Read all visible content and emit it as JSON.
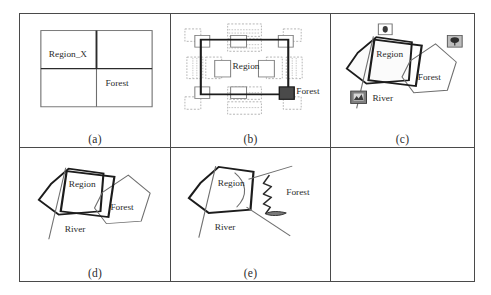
{
  "figure": {
    "panels": [
      {
        "id": "a",
        "label": "(a)",
        "caption_labels": [
          "Region_X",
          "Forest"
        ],
        "annotations": [
          {
            "name": "region-x-label",
            "text": "Region_X",
            "x": 18,
            "y": 48
          },
          {
            "name": "forest-label",
            "text": "Forest",
            "x": 79,
            "y": 80
          }
        ],
        "grid_box": {
          "x": 14,
          "y": 18,
          "w": 118,
          "h": 94,
          "split_x": 0.5,
          "split_y": 0.5
        }
      },
      {
        "id": "b",
        "label": "(b)",
        "annotations": [
          {
            "name": "region-label",
            "text": "Region",
            "x": 60,
            "y": 58
          },
          {
            "name": "forest-label",
            "text": "Forest",
            "x": 104,
            "y": 93
          }
        ],
        "selection_box": {
          "x": 28,
          "y": 25,
          "w": 88,
          "h": 70
        },
        "handle_count": 8,
        "active_handle": "bottom-right"
      },
      {
        "id": "c",
        "label": "(c)",
        "annotations": [
          {
            "name": "region-label",
            "text": "Region",
            "x": 38,
            "y": 48
          },
          {
            "name": "forest-label",
            "text": "Forest",
            "x": 84,
            "y": 80
          },
          {
            "name": "river-label",
            "text": "River",
            "x": 42,
            "y": 105
          }
        ],
        "palette_icons": [
          {
            "name": "stamp-icon",
            "x": 41,
            "y": 14
          },
          {
            "name": "tree-icon",
            "x": 108,
            "y": 27
          },
          {
            "name": "river-icon",
            "x": 18,
            "y": 94
          }
        ]
      },
      {
        "id": "d",
        "label": "(d)",
        "annotations": [
          {
            "name": "region-label",
            "text": "Region",
            "x": 42,
            "y": 36
          },
          {
            "name": "forest-label",
            "text": "Forest",
            "x": 83,
            "y": 65
          },
          {
            "name": "river-label",
            "text": "River",
            "x": 46,
            "y": 92
          }
        ]
      },
      {
        "id": "e",
        "label": "(e)",
        "annotations": [
          {
            "name": "region-label",
            "text": "Region",
            "x": 42,
            "y": 34
          },
          {
            "name": "forest-label",
            "text": "Forest",
            "x": 114,
            "y": 58
          },
          {
            "name": "river-label",
            "text": "River",
            "x": 46,
            "y": 90
          }
        ]
      },
      {
        "id": "f",
        "label": "",
        "annotations": []
      }
    ]
  },
  "colors": {
    "frame": "#4a4a4a",
    "ink": "#2b2b2b",
    "thin_line": "#6e6e6e",
    "bold_line": "#1c1c1c",
    "handle_fill": "#ffffff",
    "handle_stroke": "#8a8a8a",
    "active_handle": "#3a3a3a",
    "icon_fill": "#8c8c8c"
  }
}
